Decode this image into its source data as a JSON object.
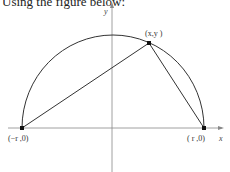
{
  "prompt": {
    "text": "Using the figure below:"
  },
  "figure": {
    "axes": {
      "x_label": "x",
      "y_label": "y"
    },
    "curve": "upper semicircle of radius r centered at origin",
    "points": [
      {
        "id": "left",
        "label": "(−r ,0)"
      },
      {
        "id": "top",
        "label": "(x,y )"
      },
      {
        "id": "right",
        "label": "( r ,0)"
      }
    ],
    "segments": [
      {
        "from": "left",
        "to": "top"
      },
      {
        "from": "top",
        "to": "right"
      }
    ],
    "colors": {
      "stroke": "#333333",
      "axis": "#888888",
      "point": "#111111"
    }
  }
}
